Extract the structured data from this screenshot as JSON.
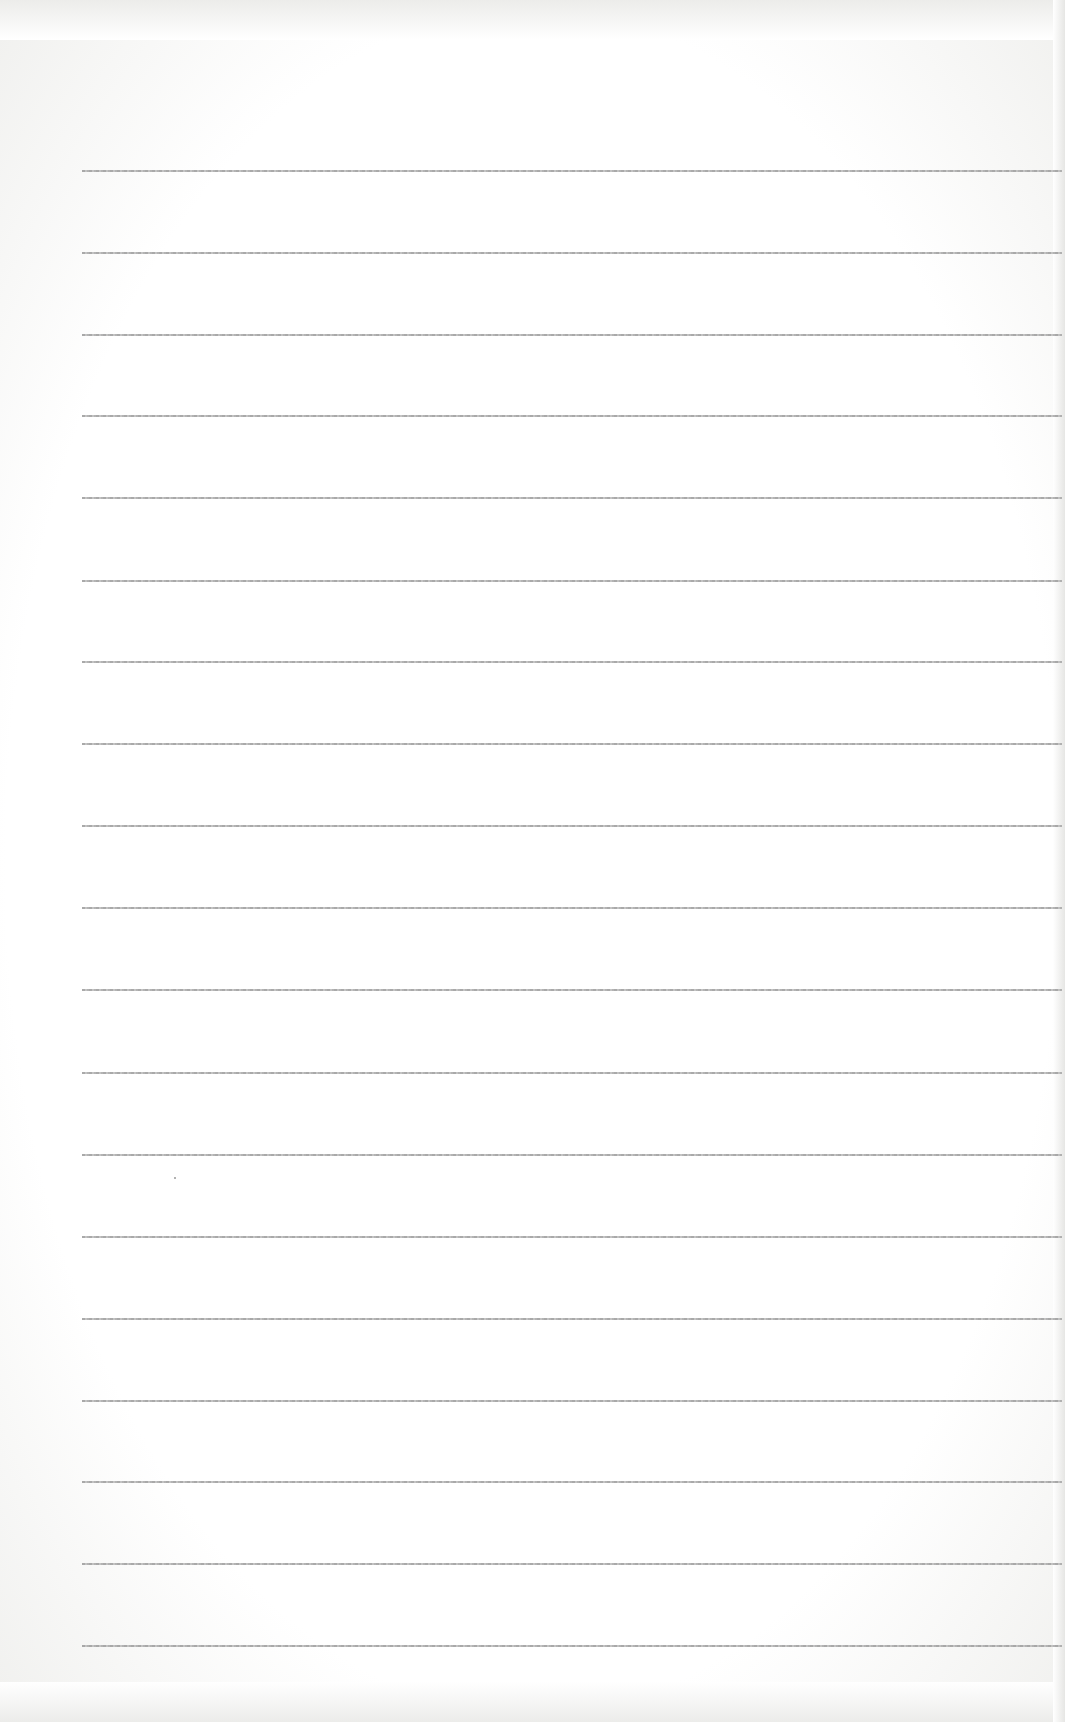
{
  "document": {
    "type": "blank lined paper",
    "ruled_line_count": 19,
    "ruled_line_y_positions": [
      170,
      252,
      334,
      415,
      497,
      580,
      661,
      743,
      825,
      907,
      989,
      1072,
      1154,
      1236,
      1318,
      1400,
      1481,
      1563,
      1645
    ],
    "line_left_x": 82,
    "line_right_x": 1062,
    "text_content": ""
  },
  "colors": {
    "paper": "#ffffff",
    "rule": "#a0a0a0"
  }
}
